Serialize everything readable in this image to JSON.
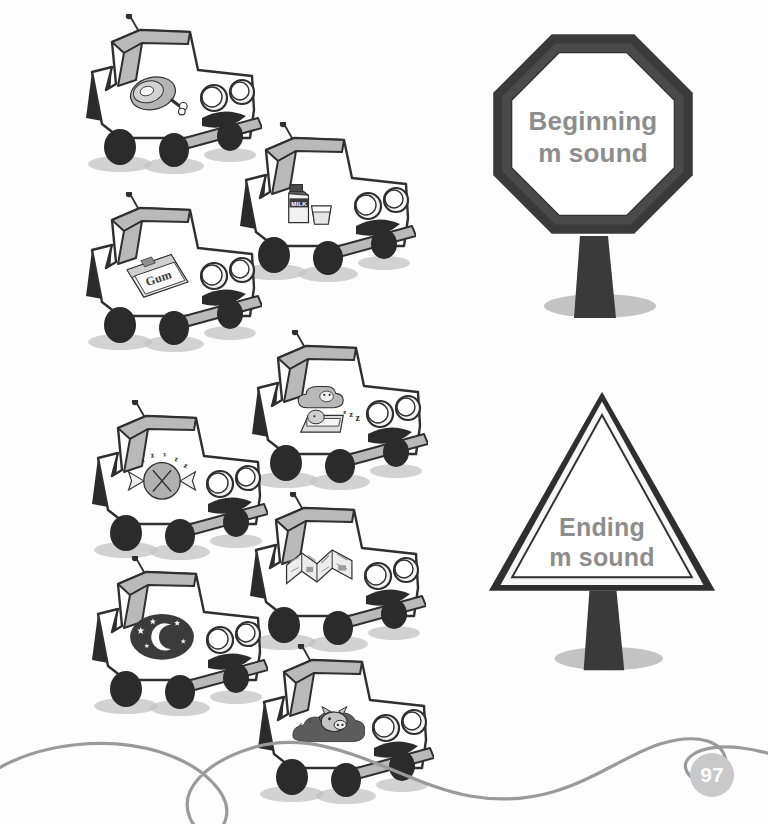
{
  "page": {
    "number": "97",
    "background_color": "#fdfdfd",
    "ink_color": "#2f2f2f",
    "text_gray": "#8d8d8d",
    "shadow_gray": "#c3c3c3",
    "swoosh_color": "#9a9a9a"
  },
  "signs": [
    {
      "id": "beginning-sign",
      "shape": "octagon",
      "line1": "Beginning",
      "line2": "m sound",
      "border_color": "#2f2f2f",
      "fill_color": "#ffffff",
      "text_color": "#8d8d8d",
      "x": 468,
      "y": 22,
      "w": 250,
      "h": 300
    },
    {
      "id": "ending-sign",
      "shape": "triangle",
      "line1": "Ending",
      "line2": "m sound",
      "border_color": "#2f2f2f",
      "fill_color": "#ffffff",
      "text_color": "#8d8d8d",
      "x": 452,
      "y": 384,
      "w": 300,
      "h": 290
    }
  ],
  "cars": [
    {
      "id": "car-ham",
      "cargo": "ham",
      "cargo_label": "ham",
      "row": 1,
      "col": "left",
      "x": 62,
      "y": 14,
      "w": 200,
      "h": 175
    },
    {
      "id": "car-milk",
      "cargo": "milk",
      "cargo_label": "milk carton and glass",
      "cargo_text": "MILK",
      "row": 2,
      "col": "right",
      "x": 216,
      "y": 122,
      "w": 200,
      "h": 175
    },
    {
      "id": "car-gum",
      "cargo": "gum",
      "cargo_label": "gum pack",
      "cargo_text": "Gum",
      "row": 3,
      "col": "left",
      "x": 62,
      "y": 192,
      "w": 200,
      "h": 175
    },
    {
      "id": "car-dream",
      "cargo": "dream",
      "cargo_label": "sleeping dreamer",
      "row": 4,
      "col": "right",
      "x": 228,
      "y": 330,
      "w": 200,
      "h": 175
    },
    {
      "id": "car-mint",
      "cargo": "mint",
      "cargo_label": "wrapped mint candy",
      "row": 5,
      "col": "left",
      "x": 68,
      "y": 400,
      "w": 200,
      "h": 175
    },
    {
      "id": "car-map",
      "cargo": "map",
      "cargo_label": "folded map",
      "row": 6,
      "col": "right",
      "x": 226,
      "y": 492,
      "w": 200,
      "h": 175
    },
    {
      "id": "car-moon",
      "cargo": "moon",
      "cargo_label": "moon and stars",
      "row": 7,
      "col": "left",
      "x": 68,
      "y": 556,
      "w": 200,
      "h": 175
    },
    {
      "id": "car-mud",
      "cargo": "mud",
      "cargo_label": "pig in mud",
      "row": 8,
      "col": "right",
      "x": 234,
      "y": 644,
      "w": 200,
      "h": 175
    }
  ],
  "decoration": {
    "swoosh_name": "wavy-road-line",
    "swoosh_color": "#9a9a9a"
  }
}
